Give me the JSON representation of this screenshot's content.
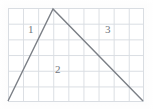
{
  "figure": {
    "title": "",
    "background_color": "#ffffff",
    "grid": {
      "line_color": "#d9dde2",
      "cell_width_px": 15.1,
      "cell_height_px": 15.7,
      "columns": 9,
      "rows": 6,
      "origin_x_px": 8,
      "origin_y_px": 8,
      "width_px": 136,
      "height_px": 94
    },
    "stroke": {
      "color": "#7b7f86",
      "width_px": 1.4
    }
  },
  "chart_data": {
    "type": "line",
    "title": "",
    "xlabel": "",
    "ylabel": "",
    "grid": true,
    "legend": "none",
    "xlim": [
      0,
      9
    ],
    "ylim": [
      0,
      6
    ],
    "series": [
      {
        "name": "peak-path",
        "x": [
          0,
          3,
          9
        ],
        "y": [
          0,
          6,
          0
        ],
        "points_px": [
          {
            "x": 8,
            "y": 101
          },
          {
            "x": 53,
            "y": 9
          },
          {
            "x": 143,
            "y": 101
          }
        ]
      }
    ],
    "annotations": [
      {
        "label": "1",
        "x_px": 28,
        "y_px": 24,
        "region": "left-of-ascending-line"
      },
      {
        "label": "2",
        "x_px": 55,
        "y_px": 64,
        "region": "inside-below-peak"
      },
      {
        "label": "3",
        "x_px": 105,
        "y_px": 24,
        "region": "upper-right-outside"
      }
    ]
  },
  "labels": {
    "one": "1",
    "two": "2",
    "three": "3"
  }
}
